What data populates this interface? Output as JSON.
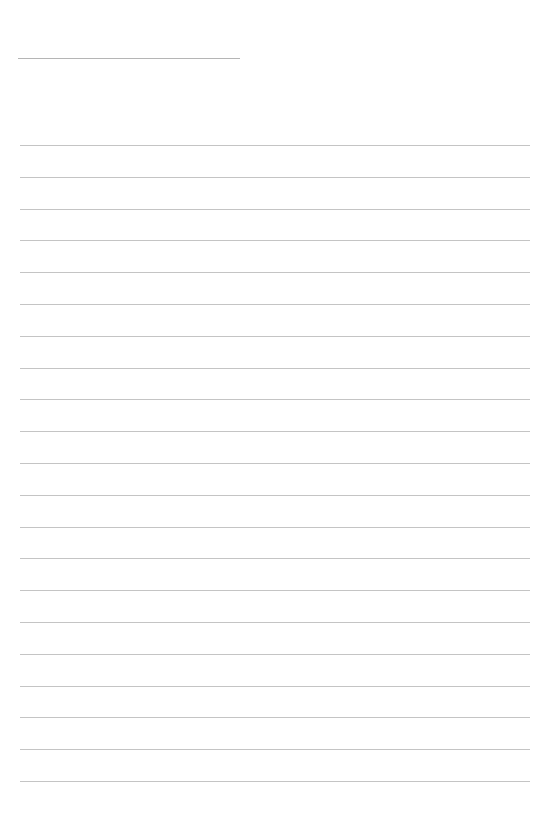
{
  "page": {
    "type": "blank lined paper",
    "background": "#ffffff",
    "line_color": "#c4c4c4",
    "header_line": {
      "present": true
    },
    "ruled_lines": {
      "count": 21,
      "first_y": 145,
      "spacing": 31.8
    }
  }
}
